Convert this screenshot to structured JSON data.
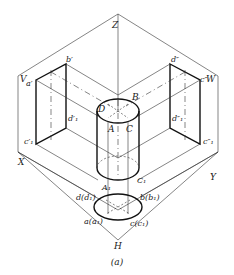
{
  "figure": {
    "caption": "(a)"
  },
  "planes": {
    "V": "V",
    "W": "W",
    "H": "H"
  },
  "axes": {
    "X": "X",
    "Y": "Y",
    "Z": "Z"
  },
  "labels": {
    "a_prime": "a′",
    "b_prime": "b′",
    "d1_prime": "d′₁",
    "c1_prime": "c′₁",
    "d_dprime": "d″",
    "c_dprime": "c″",
    "d1_dprime": "d″₁",
    "c1_dprime": "c″₁",
    "A": "A",
    "B": "B",
    "C": "C",
    "D": "D",
    "A1": "A₁",
    "C1": "C₁",
    "d_d1": "d(d₁)",
    "b_b1": "b(b₁)",
    "a_a1": "a(a₁)",
    "c_c1": "c(c₁)"
  },
  "colors": {
    "line": "#111111",
    "background": "#ffffff"
  }
}
